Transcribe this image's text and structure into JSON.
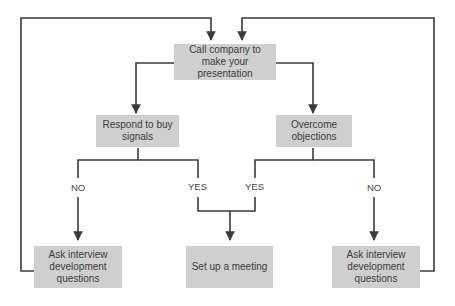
{
  "diagram": {
    "type": "flowchart",
    "colors": {
      "box_fill": "#cfcfcf",
      "line": "#3a3a3a",
      "text": "#3c3c3c",
      "background": "#ffffff"
    },
    "nodes": {
      "start": {
        "label": "Call company to make your presentation"
      },
      "buy_signals": {
        "label": "Respond to buy signals"
      },
      "objections": {
        "label": "Overcome objections"
      },
      "ask_left": {
        "label": "Ask interview development questions"
      },
      "meeting": {
        "label": "Set up a meeting"
      },
      "ask_right": {
        "label": "Ask interview development questions"
      }
    },
    "edge_labels": {
      "left_no": "NO",
      "left_yes": "YES",
      "right_yes": "YES",
      "right_no": "NO"
    }
  }
}
